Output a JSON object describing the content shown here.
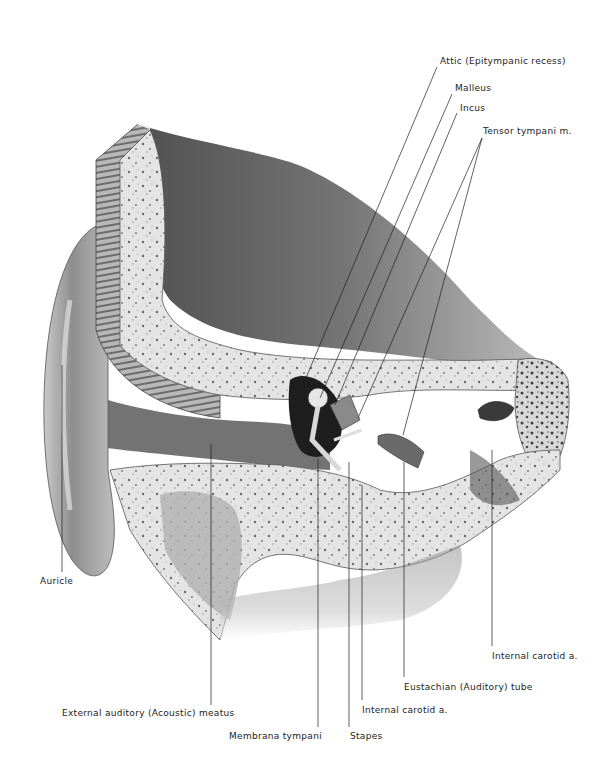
{
  "figure": {
    "background": "#ffffff",
    "ink": "#1e1e1e"
  },
  "labels": [
    {
      "id": "attic",
      "text": "Attic (Epitympanic recess)",
      "x": 440,
      "y": 57,
      "lines": [
        [
          437,
          67,
          300,
          392
        ]
      ]
    },
    {
      "id": "malleus",
      "text": "Malleus",
      "x": 455,
      "y": 84,
      "lines": [
        [
          452,
          94,
          320,
          398
        ]
      ]
    },
    {
      "id": "incus",
      "text": "Incus",
      "x": 460,
      "y": 104,
      "lines": [
        [
          457,
          113,
          335,
          405
        ]
      ]
    },
    {
      "id": "tensor-tympani",
      "text": "Tensor tympani m.",
      "x": 483,
      "y": 127,
      "lines": [
        [
          482,
          138,
          358,
          418
        ],
        [
          482,
          138,
          403,
          435
        ]
      ]
    },
    {
      "id": "auricle",
      "text": "Auricle",
      "x": 40,
      "y": 577,
      "lines": [
        [
          62,
          365,
          62,
          572
        ]
      ]
    },
    {
      "id": "external-auditory-meatus",
      "text": "External auditory (Acoustic) meatus",
      "x": 62,
      "y": 709,
      "lines": [
        [
          211,
          444,
          211,
          705
        ]
      ]
    },
    {
      "id": "membrana-tympani",
      "text": "Membrana tympani",
      "x": 229,
      "y": 732,
      "lines": [
        [
          318,
          459,
          318,
          727
        ]
      ]
    },
    {
      "id": "stapes",
      "text": "Stapes",
      "x": 350,
      "y": 732,
      "lines": [
        [
          349,
          462,
          349,
          727
        ]
      ]
    },
    {
      "id": "internal-carotid-lower",
      "text": "Internal carotid a.",
      "x": 362,
      "y": 706,
      "lines": [
        [
          362,
          485,
          362,
          700
        ]
      ]
    },
    {
      "id": "eustachian-tube",
      "text": "Eustachian (Auditory) tube",
      "x": 404,
      "y": 683,
      "lines": [
        [
          404,
          462,
          404,
          677
        ]
      ]
    },
    {
      "id": "internal-carotid-upper",
      "text": "Internal carotid a.",
      "x": 492,
      "y": 652,
      "lines": [
        [
          492,
          450,
          492,
          646
        ]
      ]
    }
  ]
}
